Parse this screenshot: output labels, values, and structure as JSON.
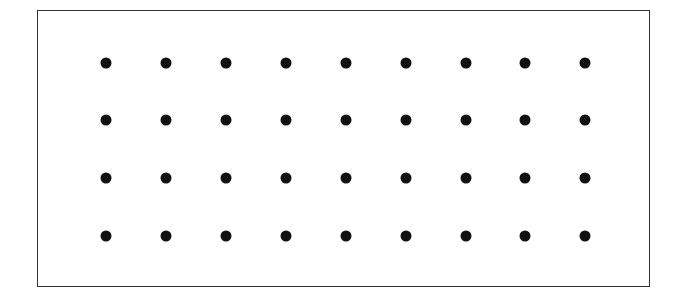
{
  "diagram": {
    "rows": 4,
    "columns": 9,
    "total_dots": 36,
    "dot_color": "#111111",
    "border_color": "#333333",
    "x_positions": [
      106,
      166,
      226,
      286,
      346,
      406,
      466,
      525,
      585
    ],
    "y_positions": [
      63,
      120,
      178,
      236
    ]
  }
}
